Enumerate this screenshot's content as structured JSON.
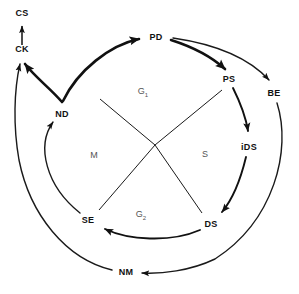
{
  "diagram": {
    "type": "cell-cycle-flow-diagram",
    "background_color": "#ffffff",
    "line_color": "#111111",
    "label_color": "#111111",
    "phase_label_color": "#555555",
    "nodes": [
      {
        "id": "CS",
        "label": "CS",
        "x": 22,
        "y": 16
      },
      {
        "id": "CK",
        "label": "CK",
        "x": 22,
        "y": 52
      },
      {
        "id": "ND",
        "label": "ND",
        "x": 62,
        "y": 114
      },
      {
        "id": "PD",
        "label": "PD",
        "x": 156,
        "y": 37
      },
      {
        "id": "PS",
        "label": "PS",
        "x": 229,
        "y": 79
      },
      {
        "id": "BE",
        "label": "BE",
        "x": 274,
        "y": 93
      },
      {
        "id": "iDS",
        "label": "iDS",
        "x": 249,
        "y": 147
      },
      {
        "id": "DS",
        "label": "DS",
        "x": 211,
        "y": 224
      },
      {
        "id": "SE",
        "label": "SE",
        "x": 88,
        "y": 220
      },
      {
        "id": "NM",
        "label": "NM",
        "x": 126,
        "y": 272
      }
    ],
    "phases": [
      {
        "id": "G1",
        "label": "G",
        "sub": "1",
        "x": 143,
        "y": 91
      },
      {
        "id": "S",
        "label": "S",
        "sub": "",
        "x": 205,
        "y": 154
      },
      {
        "id": "G2",
        "label": "G",
        "sub": "2",
        "x": 141,
        "y": 214
      },
      {
        "id": "M",
        "label": "M",
        "sub": "",
        "x": 94,
        "y": 155
      }
    ],
    "edges": [
      {
        "from": "CK",
        "to": "CS",
        "style": "straight-arrow"
      },
      {
        "from": "ND",
        "to": "CK",
        "style": "thick-curve-arrow"
      },
      {
        "from": "ND",
        "to": "PD",
        "style": "thick-curve-arrow"
      },
      {
        "from": "PD",
        "to": "PS",
        "style": "thick-curve-arrow"
      },
      {
        "from": "PD",
        "to": "BE",
        "style": "thin-curve-arrow"
      },
      {
        "from": "PS",
        "to": "iDS",
        "style": "medium-curve-arrow"
      },
      {
        "from": "iDS",
        "to": "DS",
        "style": "medium-curve-arrow"
      },
      {
        "from": "DS",
        "to": "SE",
        "style": "medium-curve-arrow"
      },
      {
        "from": "SE",
        "to": "ND",
        "style": "thin-arc-arrow"
      },
      {
        "from": "BE",
        "to": "NM",
        "style": "thin-arc-arrow"
      },
      {
        "from": "NM",
        "to": "CK",
        "style": "thin-arc-arrow"
      }
    ],
    "center": {
      "x": 155,
      "y": 145
    }
  }
}
